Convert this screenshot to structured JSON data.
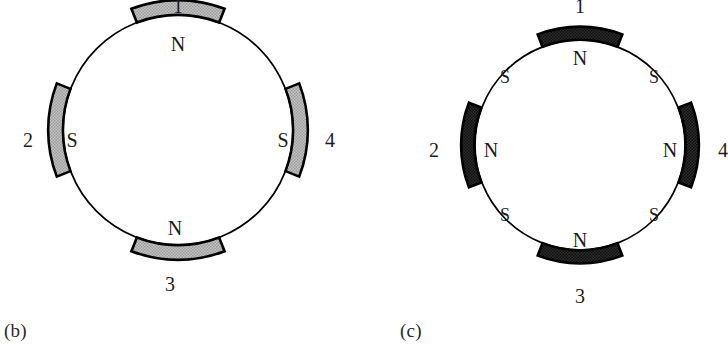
{
  "figure": {
    "kind": "magnetic-pole-ring-diagrams",
    "panel_count": 2
  },
  "colors": {
    "ink": "#000000",
    "paper": "#ffffff",
    "pole_light_fill": "#b9b9b9",
    "pole_dark_fill": "#2a2a2a",
    "caption_text": "#2b2b2b"
  },
  "panels": [
    {
      "id": "b",
      "caption": "(b)",
      "circle": {
        "cx": 178,
        "cy": 130,
        "r": 115
      },
      "pole_shading": "light",
      "outer_numbers": [
        {
          "label": "1",
          "position": "top",
          "x": 178,
          "y": 6
        },
        {
          "label": "2",
          "position": "left",
          "x": 28,
          "y": 140
        },
        {
          "label": "3",
          "position": "bottom",
          "x": 170,
          "y": 284
        },
        {
          "label": "4",
          "position": "right",
          "x": 330,
          "y": 140
        }
      ],
      "inner_poles": [
        {
          "label": "N",
          "position": "top",
          "x": 178,
          "y": 44
        },
        {
          "label": "S",
          "position": "left",
          "x": 72,
          "y": 140
        },
        {
          "label": "N",
          "position": "bottom",
          "x": 175,
          "y": 228
        },
        {
          "label": "S",
          "position": "right",
          "x": 283,
          "y": 140
        }
      ],
      "interstitial_poles": []
    },
    {
      "id": "c",
      "caption": "(c)",
      "circle": {
        "cx": 580,
        "cy": 145,
        "r": 105
      },
      "pole_shading": "dark",
      "outer_numbers": [
        {
          "label": "1",
          "position": "top",
          "x": 580,
          "y": 6
        },
        {
          "label": "2",
          "position": "left",
          "x": 434,
          "y": 150
        },
        {
          "label": "3",
          "position": "bottom",
          "x": 580,
          "y": 296
        },
        {
          "label": "4",
          "position": "right",
          "x": 723,
          "y": 150
        }
      ],
      "inner_poles": [
        {
          "label": "N",
          "position": "top",
          "x": 580,
          "y": 58
        },
        {
          "label": "N",
          "position": "left",
          "x": 491,
          "y": 150
        },
        {
          "label": "N",
          "position": "bottom",
          "x": 580,
          "y": 240
        },
        {
          "label": "N",
          "position": "right",
          "x": 670,
          "y": 150
        }
      ],
      "interstitial_poles": [
        {
          "label": "S",
          "position": "top-left",
          "x": 505,
          "y": 77
        },
        {
          "label": "S",
          "position": "top-right",
          "x": 654,
          "y": 77
        },
        {
          "label": "S",
          "position": "bottom-left",
          "x": 505,
          "y": 215
        },
        {
          "label": "S",
          "position": "bottom-right",
          "x": 654,
          "y": 215
        }
      ]
    }
  ]
}
